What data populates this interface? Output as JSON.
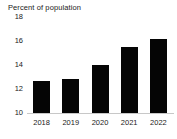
{
  "chart_data": {
    "type": "bar",
    "title": "Percent of population",
    "xlabel": "",
    "ylabel": "",
    "categories": [
      "2018",
      "2019",
      "2020",
      "2021",
      "2022"
    ],
    "values": [
      12.7,
      12.8,
      14.0,
      15.5,
      16.2
    ],
    "ylim": [
      10,
      18
    ],
    "yticks": [
      "10",
      "12",
      "14",
      "16",
      "18"
    ],
    "ytick_values": [
      10,
      12,
      14,
      16,
      18
    ],
    "grid": false,
    "legend": null,
    "series": [
      {
        "name": "Percent of population",
        "values": [
          12.7,
          12.8,
          14.0,
          15.5,
          16.2
        ],
        "color": "#050505"
      }
    ],
    "colors": {
      "bar": "#050505",
      "axis": "#c8c8c8",
      "text": "#1a1a1a",
      "background": "#ffffff"
    }
  }
}
